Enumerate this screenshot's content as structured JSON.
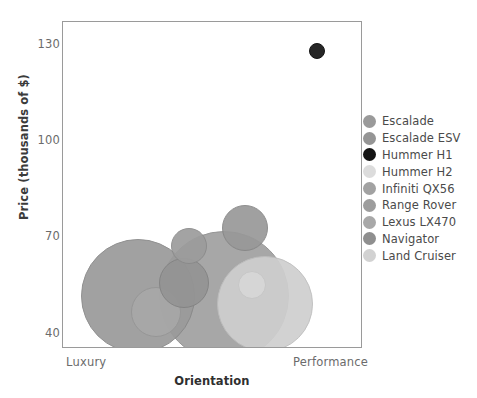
{
  "chart_data": {
    "type": "scatter",
    "title": "",
    "xlabel": "Orientation",
    "ylabel": "Price (thousands of $)",
    "x_tick_labels": [
      "Luxury",
      "Performance"
    ],
    "y_tick_labels": [
      "130",
      "100",
      "70",
      "40"
    ],
    "y_ticks": [
      130,
      100,
      70,
      40
    ],
    "ylim": [
      34,
      139
    ],
    "xlim": [
      0,
      1
    ],
    "grid": false,
    "legend_position": "right",
    "note": "Bubble chart: bubble size encodes a third variable (vehicle size); x position is categorical-continuous from Luxury to Performance.",
    "series": [
      {
        "name": "Escalade",
        "x": 0.25,
        "y": 51.0,
        "size": 57,
        "color": "#9a9a9a"
      },
      {
        "name": "Escalade ESV",
        "x": 0.537,
        "y": 51.0,
        "size": 65,
        "color": "#a0a0a0"
      },
      {
        "name": "Hummer H1",
        "x": 0.847,
        "y": 129.7,
        "size": 8,
        "color": "#141414"
      },
      {
        "name": "Hummer H2",
        "x": 0.63,
        "y": 54.5,
        "size": 14,
        "color": "#d8d8d8"
      },
      {
        "name": "Infiniti QX56",
        "x": 0.42,
        "y": 67.2,
        "size": 18,
        "color": "#9c9c9c"
      },
      {
        "name": "Range Rover",
        "x": 0.607,
        "y": 73.0,
        "size": 23,
        "color": "#989898"
      },
      {
        "name": "Lexus LX470",
        "x": 0.31,
        "y": 46.0,
        "size": 25,
        "color": "#a8a8a8"
      },
      {
        "name": "Navigator",
        "x": 0.403,
        "y": 55.3,
        "size": 25,
        "color": "#949494"
      },
      {
        "name": "Land Cruiser",
        "x": 0.673,
        "y": 48.3,
        "size": 48,
        "color": "#cfcfcf"
      }
    ]
  },
  "axes": {
    "y_title": "Price (thousands of $)",
    "x_title": "Orientation",
    "x_left_label": "Luxury",
    "x_right_label": "Performance",
    "y_tick_0": "130",
    "y_tick_1": "100",
    "y_tick_2": "70",
    "y_tick_3": "40"
  },
  "legend": {
    "items": [
      {
        "label": "Escalade",
        "color": "#9a9a9a"
      },
      {
        "label": "Escalade ESV",
        "color": "#959595"
      },
      {
        "label": "Hummer H1",
        "color": "#141414"
      },
      {
        "label": "Hummer H2",
        "color": "#dcdcdc"
      },
      {
        "label": "Infiniti QX56",
        "color": "#a2a2a2"
      },
      {
        "label": "Range Rover",
        "color": "#9d9d9d"
      },
      {
        "label": "Lexus LX470",
        "color": "#a8a8a8"
      },
      {
        "label": "Navigator",
        "color": "#8f8f8f"
      },
      {
        "label": "Land Cruiser",
        "color": "#d2d2d2"
      }
    ]
  },
  "colors": {
    "frame": "#9a9a9a",
    "tick_text": "#6b6b6b",
    "axis_title": "#2f2f2f",
    "legend_text": "#4a4a4a",
    "background": "#ffffff"
  }
}
